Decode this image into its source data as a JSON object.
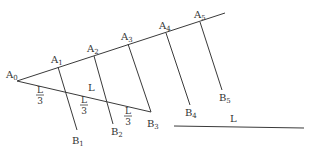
{
  "diagram": {
    "stroke_color": "#3a3a3a",
    "text_color": "#333333",
    "upper_ray": {
      "start": [
        17,
        81
      ],
      "end": [
        225,
        13
      ],
      "points": [
        {
          "name": "A",
          "sub": "0",
          "x": 17,
          "y": 81,
          "lx": 6,
          "ly": 78
        },
        {
          "name": "A",
          "sub": "1",
          "x": 58,
          "y": 67,
          "lx": 51,
          "ly": 63
        },
        {
          "name": "A",
          "sub": "2",
          "x": 94,
          "y": 56,
          "lx": 87,
          "ly": 52
        },
        {
          "name": "A",
          "sub": "3",
          "x": 128,
          "y": 44,
          "lx": 121,
          "ly": 40
        },
        {
          "name": "A",
          "sub": "4",
          "x": 166,
          "y": 33,
          "lx": 159,
          "ly": 29
        },
        {
          "name": "A",
          "sub": "5",
          "x": 200,
          "y": 22,
          "lx": 194,
          "ly": 18
        }
      ]
    },
    "lower_segment": {
      "start": [
        17,
        81
      ],
      "end": [
        151,
        112
      ],
      "label": "L",
      "label_pos": [
        88,
        91
      ]
    },
    "parallels": [
      {
        "from": [
          58,
          67
        ],
        "to": [
          77,
          130
        ],
        "name": "B",
        "sub": "1",
        "lx": 72,
        "ly": 144
      },
      {
        "from": [
          94,
          56
        ],
        "to": [
          113,
          124
        ],
        "name": "B",
        "sub": "2",
        "lx": 111,
        "ly": 135
      },
      {
        "from": [
          128,
          44
        ],
        "to": [
          151,
          112
        ],
        "name": "B",
        "sub": "3",
        "lx": 147,
        "ly": 127
      },
      {
        "from": [
          166,
          33
        ],
        "to": [
          190,
          105
        ],
        "name": "B",
        "sub": "4",
        "lx": 185,
        "ly": 116
      },
      {
        "from": [
          200,
          22
        ],
        "to": [
          222,
          90
        ],
        "name": "B",
        "sub": "5",
        "lx": 219,
        "ly": 101
      }
    ],
    "fractions": [
      {
        "num": "L",
        "den": "3",
        "x": 40,
        "y": 96
      },
      {
        "num": "L",
        "den": "3",
        "x": 84,
        "y": 106
      },
      {
        "num": "L",
        "den": "3",
        "x": 128,
        "y": 117
      }
    ],
    "reference_segment": {
      "start": [
        174,
        126
      ],
      "end": [
        304,
        128
      ],
      "label": "L",
      "label_pos": [
        230,
        122
      ]
    }
  }
}
